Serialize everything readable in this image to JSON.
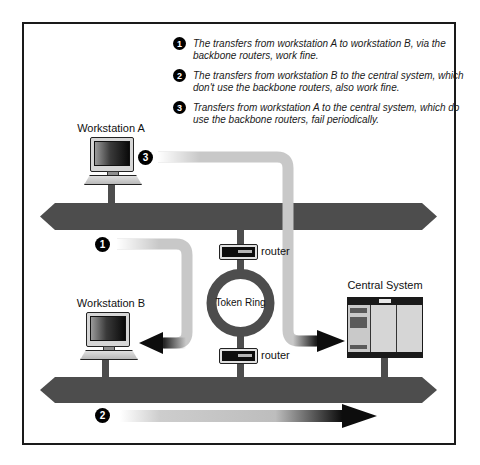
{
  "diagram": {
    "annotations": [
      {
        "num": "1",
        "text": "The transfers from workstation A to workstation B, via the backbone routers, work fine."
      },
      {
        "num": "2",
        "text": "The transfers from workstation B to the central system, which don't use the backbone routers, also work fine."
      },
      {
        "num": "3",
        "text": "Transfers from workstation A to the central system, which do use the backbone routers, fail periodically."
      }
    ],
    "labels": {
      "workstation_a": "Workstation A",
      "workstation_b": "Workstation B",
      "central_system": "Central System",
      "token_ring": "Token Ring",
      "router_top": "router",
      "router_bottom": "router"
    },
    "flow_markers": {
      "workstation_a_badge": "3",
      "backbone_flow_badge": "1",
      "bottom_flow_badge": "2"
    },
    "colors": {
      "backbone_bar": "#4d4d4d",
      "flow_path_light": "#c8c8c8",
      "arrow_dark": "#0d0d0d",
      "marker_badge": "#000000"
    }
  }
}
